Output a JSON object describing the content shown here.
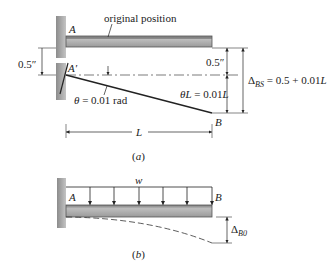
{
  "figure_a": {
    "caption": "(a)",
    "label_original": "original position",
    "label_A": "A",
    "label_A_prime": "A′",
    "label_B": "B",
    "dim_left_offset": "0.5″",
    "dim_right_offset": "0.5″",
    "theta_label": "θ = 0.01 rad",
    "theta_L_label": "θL = 0.01L",
    "delta_symbol": "Δ",
    "delta_sub": "BS",
    "delta_expr": " = 0.5 + 0.01L",
    "length_label": "L"
  },
  "figure_b": {
    "caption": "(b)",
    "load_label": "w",
    "label_A": "A",
    "label_B": "B",
    "delta_symbol": "Δ",
    "delta_sub": "B0"
  },
  "colors": {
    "beam_fill": "#b9b9b9",
    "beam_edge": "#555555",
    "wall_fill": "#a8a8a8",
    "line": "#222222"
  }
}
